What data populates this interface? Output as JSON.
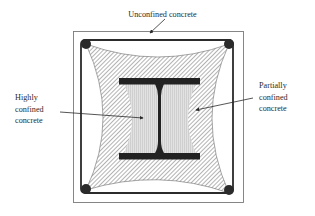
{
  "figure": {
    "type": "cross-section diagram"
  },
  "labels": {
    "unconfined": "Unconfined concrete",
    "highly_confined": [
      "Highly",
      "confined",
      "concrete"
    ],
    "partially_confined": [
      "Partially",
      "confined",
      "concrete"
    ]
  },
  "colors": {
    "outline": "#7a7a7a",
    "tie": "#2b2b2b",
    "steel": "#222222",
    "hatch": "#8a8a8a",
    "highly_confined_fill": "#d9d9d9",
    "background": "#ffffff"
  }
}
